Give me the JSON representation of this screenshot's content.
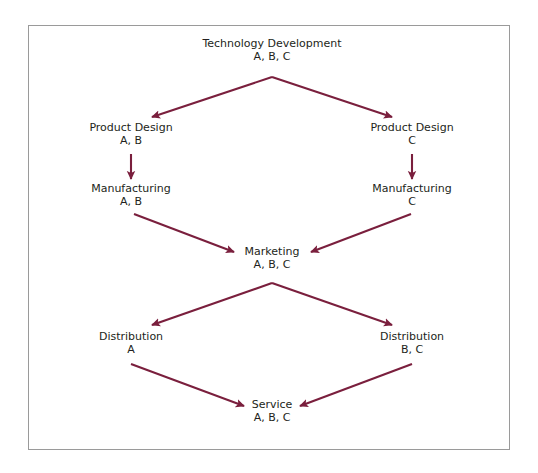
{
  "diagram": {
    "type": "flow-diagram",
    "line_color": "#7a1f3d",
    "border_color": "#9a9a9a",
    "background_color": "#ffffff",
    "text_color": "#231f20",
    "nodes": [
      {
        "id": "technology-development",
        "label": "Technology Development",
        "tags": "A, B, C",
        "x": 272,
        "y": 44
      },
      {
        "id": "product-design-left",
        "label": "Product Design",
        "tags": "A, B",
        "x": 131,
        "y": 127
      },
      {
        "id": "product-design-right",
        "label": "Product Design",
        "tags": "C",
        "x": 412,
        "y": 127
      },
      {
        "id": "manufacturing-left",
        "label": "Manufacturing",
        "tags": "A, B",
        "x": 131,
        "y": 188
      },
      {
        "id": "manufacturing-right",
        "label": "Manufacturing",
        "tags": "C",
        "x": 412,
        "y": 188
      },
      {
        "id": "marketing",
        "label": "Marketing",
        "tags": "A, B, C",
        "x": 272,
        "y": 251
      },
      {
        "id": "distribution-left",
        "label": "Distribution",
        "tags": "A",
        "x": 131,
        "y": 336
      },
      {
        "id": "distribution-right",
        "label": "Distribution",
        "tags": "B, C",
        "x": 412,
        "y": 336
      },
      {
        "id": "service",
        "label": "Service",
        "tags": "A, B, C",
        "x": 272,
        "y": 404
      }
    ],
    "edges": [
      {
        "id": "edge-techdev-to-product-design-left",
        "from": "technology-development",
        "to": "product-design-left"
      },
      {
        "id": "edge-techdev-to-product-design-right",
        "from": "technology-development",
        "to": "product-design-right"
      },
      {
        "id": "edge-product-design-left-to-manufacturing-left",
        "from": "product-design-left",
        "to": "manufacturing-left"
      },
      {
        "id": "edge-product-design-right-to-manufacturing-right",
        "from": "product-design-right",
        "to": "manufacturing-right"
      },
      {
        "id": "edge-manufacturing-left-to-marketing",
        "from": "manufacturing-left",
        "to": "marketing"
      },
      {
        "id": "edge-manufacturing-right-to-marketing",
        "from": "manufacturing-right",
        "to": "marketing"
      },
      {
        "id": "edge-marketing-to-distribution-left",
        "from": "marketing",
        "to": "distribution-left"
      },
      {
        "id": "edge-marketing-to-distribution-right",
        "from": "marketing",
        "to": "distribution-right"
      },
      {
        "id": "edge-distribution-left-to-service",
        "from": "distribution-left",
        "to": "service"
      },
      {
        "id": "edge-distribution-right-to-service",
        "from": "distribution-right",
        "to": "service"
      }
    ]
  }
}
